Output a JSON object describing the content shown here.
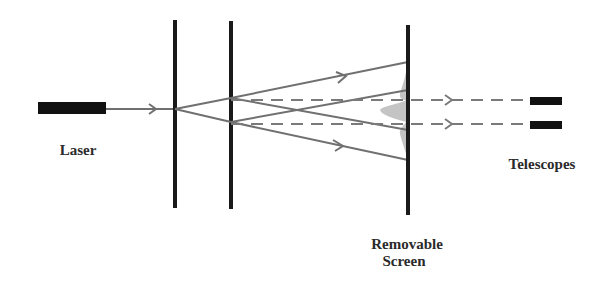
{
  "diagram": {
    "labels": {
      "laser": "Laser",
      "screen_line1": "Removable",
      "screen_line2": "Screen",
      "telescopes": "Telescopes"
    },
    "components": [
      {
        "name": "laser",
        "type": "source"
      },
      {
        "name": "single-slit-barrier",
        "type": "barrier"
      },
      {
        "name": "double-slit-barrier",
        "type": "barrier"
      },
      {
        "name": "removable-screen",
        "type": "screen"
      },
      {
        "name": "telescope-upper",
        "type": "detector"
      },
      {
        "name": "telescope-lower",
        "type": "detector"
      }
    ],
    "colors": {
      "barrier": "#1a1a1a",
      "ray": "#707070",
      "dashed_ray": "#7a7a7a",
      "interference_pattern": "#c4c4c4",
      "text": "#2a2a2a"
    }
  }
}
